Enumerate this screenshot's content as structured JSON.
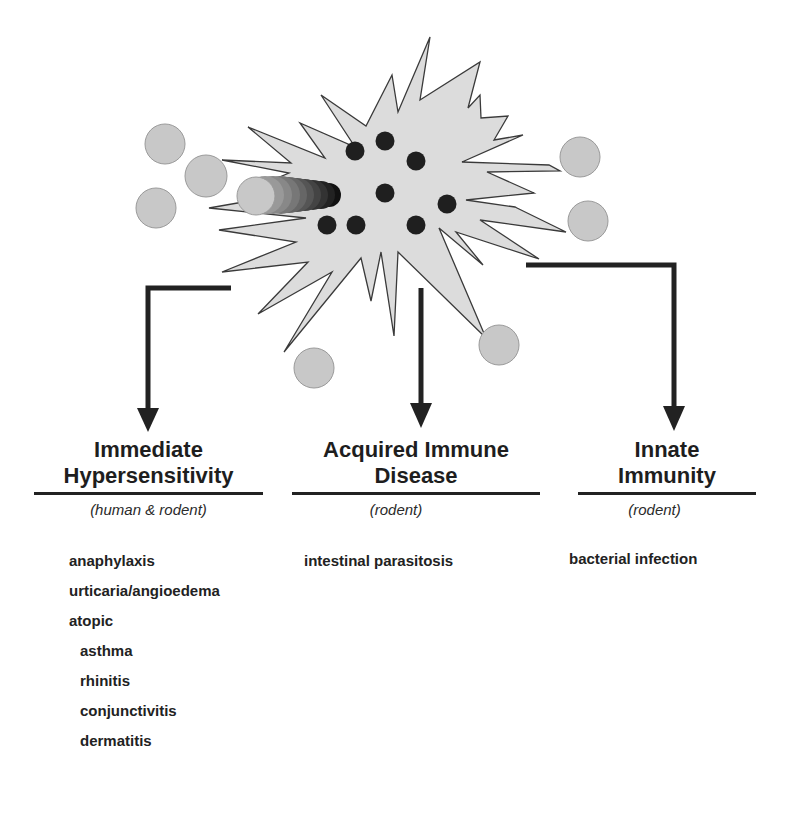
{
  "diagram": {
    "center_cell": {
      "label": "mast cell (spiky, degranulating)",
      "fill": "#dcdcdc",
      "granule_color": "#1f1f1f"
    },
    "particles": {
      "fill": "#c8c8c8",
      "stroke": "#9a9a9a"
    },
    "arrow_color": "#222222"
  },
  "branches": [
    {
      "heading": [
        "Immediate",
        "Hypersensitivity"
      ],
      "host": "(human & rodent)",
      "items": [
        {
          "label": "anaphylaxis",
          "indent": false
        },
        {
          "label": "urticaria/angioedema",
          "indent": false
        },
        {
          "label": "atopic",
          "indent": false
        },
        {
          "label": "asthma",
          "indent": true
        },
        {
          "label": "rhinitis",
          "indent": true
        },
        {
          "label": "conjunctivitis",
          "indent": true
        },
        {
          "label": "dermatitis",
          "indent": true
        }
      ]
    },
    {
      "heading": [
        "Acquired Immune",
        "Disease"
      ],
      "host": "(rodent)",
      "items": [
        {
          "label": "intestinal parasitosis",
          "indent": false
        }
      ]
    },
    {
      "heading": [
        "Innate",
        "Immunity"
      ],
      "host": "(rodent)",
      "items": [
        {
          "label": "bacterial infection",
          "indent": false
        }
      ]
    }
  ]
}
